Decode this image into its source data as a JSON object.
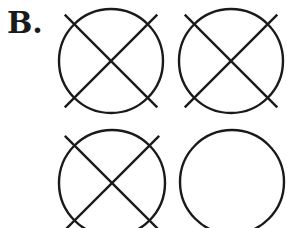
{
  "label": "B.",
  "stroke_color": "#1a1a1a",
  "figures": [
    {
      "id": "top-left",
      "cx": 111,
      "cy": 61,
      "r": 52,
      "crossed": true
    },
    {
      "id": "top-right",
      "cx": 231,
      "cy": 61,
      "r": 52,
      "crossed": true
    },
    {
      "id": "bottom-left",
      "cx": 112,
      "cy": 183,
      "r": 53,
      "crossed": true
    },
    {
      "id": "bottom-right",
      "cx": 232,
      "cy": 182,
      "r": 52,
      "crossed": false
    }
  ]
}
